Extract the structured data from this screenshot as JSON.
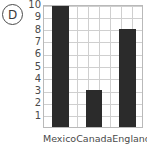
{
  "marker": {
    "letter": "D"
  },
  "chart_data": {
    "type": "bar",
    "title": "",
    "subtitle": "",
    "xlabel": "",
    "ylabel": "",
    "categories": [
      "Mexico",
      "Canada",
      "England"
    ],
    "values": [
      10,
      3,
      8
    ],
    "series": [
      {
        "name": "",
        "values": [
          10,
          3,
          8
        ]
      }
    ],
    "ylim": [
      0,
      10
    ],
    "yticks": [
      10,
      9,
      8,
      7,
      6,
      5,
      4,
      3,
      2,
      1
    ],
    "ytick_labels": [
      "10",
      "9",
      "8",
      "7",
      "6",
      "5",
      "4",
      "3",
      "2",
      "1"
    ],
    "grid": true,
    "grid_axis": "both",
    "legend": false,
    "legend_position": "none",
    "bar_color": "#2b2b2b",
    "grid_color": "#cfcfcf",
    "axis_color": "#b9b9b9",
    "text_color": "#4a4a4a",
    "background": "#ffffff",
    "annotations": [
      "D"
    ]
  }
}
